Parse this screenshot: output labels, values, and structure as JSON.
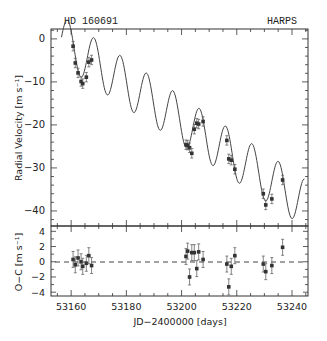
{
  "chart_data": [
    {
      "type": "scatter",
      "panel": "top",
      "title_left": "HD 160691",
      "title_right": "HARPS",
      "xlabel": "",
      "ylabel": "Radial Velocity [m s⁻¹]",
      "xlim": [
        53152.7,
        53245.8
      ],
      "ylim": [
        -43.5,
        2.3
      ],
      "yticks": [
        0,
        -10,
        -20,
        -30,
        -40
      ],
      "grid": false,
      "series": [
        {
          "name": "HARPS RV measurements",
          "style": "points-with-errorbars",
          "x": [
            53160.7,
            53161.5,
            53162.5,
            53163.6,
            53164.2,
            53165.5,
            53166.4,
            53167.4,
            53201.6,
            53202.2,
            53202.9,
            53203.7,
            53204.6,
            53205.5,
            53206.2,
            53207.8,
            53216.4,
            53217.1,
            53218.0,
            53219.3,
            53229.6,
            53230.5,
            53232.7,
            53236.6
          ],
          "y": [
            -1.7,
            -5.6,
            -7.9,
            -9.9,
            -10.4,
            -8.9,
            -5.4,
            -4.9,
            -24.6,
            -24.7,
            -25.3,
            -26.6,
            -21.0,
            -19.6,
            -19.8,
            -19.2,
            -23.6,
            -27.9,
            -28.2,
            -30.3,
            -36.0,
            -38.6,
            -37.2,
            -32.8
          ],
          "yerr": 1.1
        },
        {
          "name": "Keplerian fit",
          "style": "line",
          "x_range": [
            53156.5,
            53244.5
          ],
          "model": "trend + sinusoid",
          "trend_per_day": -0.43,
          "offset_at_53160": -1.0,
          "amplitude": 5.6,
          "period_days": 9.55,
          "phase_peak_jd": 53158.7
        }
      ]
    },
    {
      "type": "scatter",
      "panel": "bottom",
      "xlabel": "JD−2400000 [days]",
      "ylabel": "O−C [m s⁻¹]",
      "xlim": [
        53152.7,
        53245.8
      ],
      "ylim": [
        -4.5,
        4.7
      ],
      "xticks": [
        53160,
        53180,
        53200,
        53220,
        53240
      ],
      "yticks": [
        4,
        2,
        0,
        -2,
        -4
      ],
      "grid": false,
      "zero_line": "dashed",
      "series": [
        {
          "name": "Residuals",
          "style": "points-with-errorbars",
          "x": [
            53160.7,
            53161.5,
            53162.5,
            53163.6,
            53164.2,
            53165.5,
            53166.4,
            53167.4,
            53201.6,
            53202.2,
            53202.9,
            53203.7,
            53204.6,
            53205.5,
            53206.2,
            53207.8,
            53216.4,
            53217.1,
            53218.0,
            53219.3,
            53229.6,
            53230.5,
            53232.7,
            53236.6
          ],
          "y": [
            0.3,
            -0.4,
            0.5,
            0.0,
            -0.6,
            -0.2,
            0.8,
            -0.5,
            0.7,
            1.4,
            -2.0,
            1.2,
            1.2,
            -0.9,
            1.3,
            0.3,
            -0.3,
            -3.3,
            -0.6,
            0.8,
            -0.3,
            -1.3,
            -0.5,
            1.9
          ],
          "yerr": 1.05
        }
      ]
    }
  ],
  "labels": {
    "star_name": "HD 160691",
    "instrument": "HARPS",
    "top_ylabel": "Radial Velocity [m s⁻¹]",
    "bottom_ylabel": "O−C [m s⁻¹]",
    "xlabel": "JD−2400000 [days]"
  },
  "colors": {
    "frame": "#333333",
    "line": "#444444",
    "points": "#333333",
    "errorbars": "#666666",
    "background": "#ffffff"
  }
}
